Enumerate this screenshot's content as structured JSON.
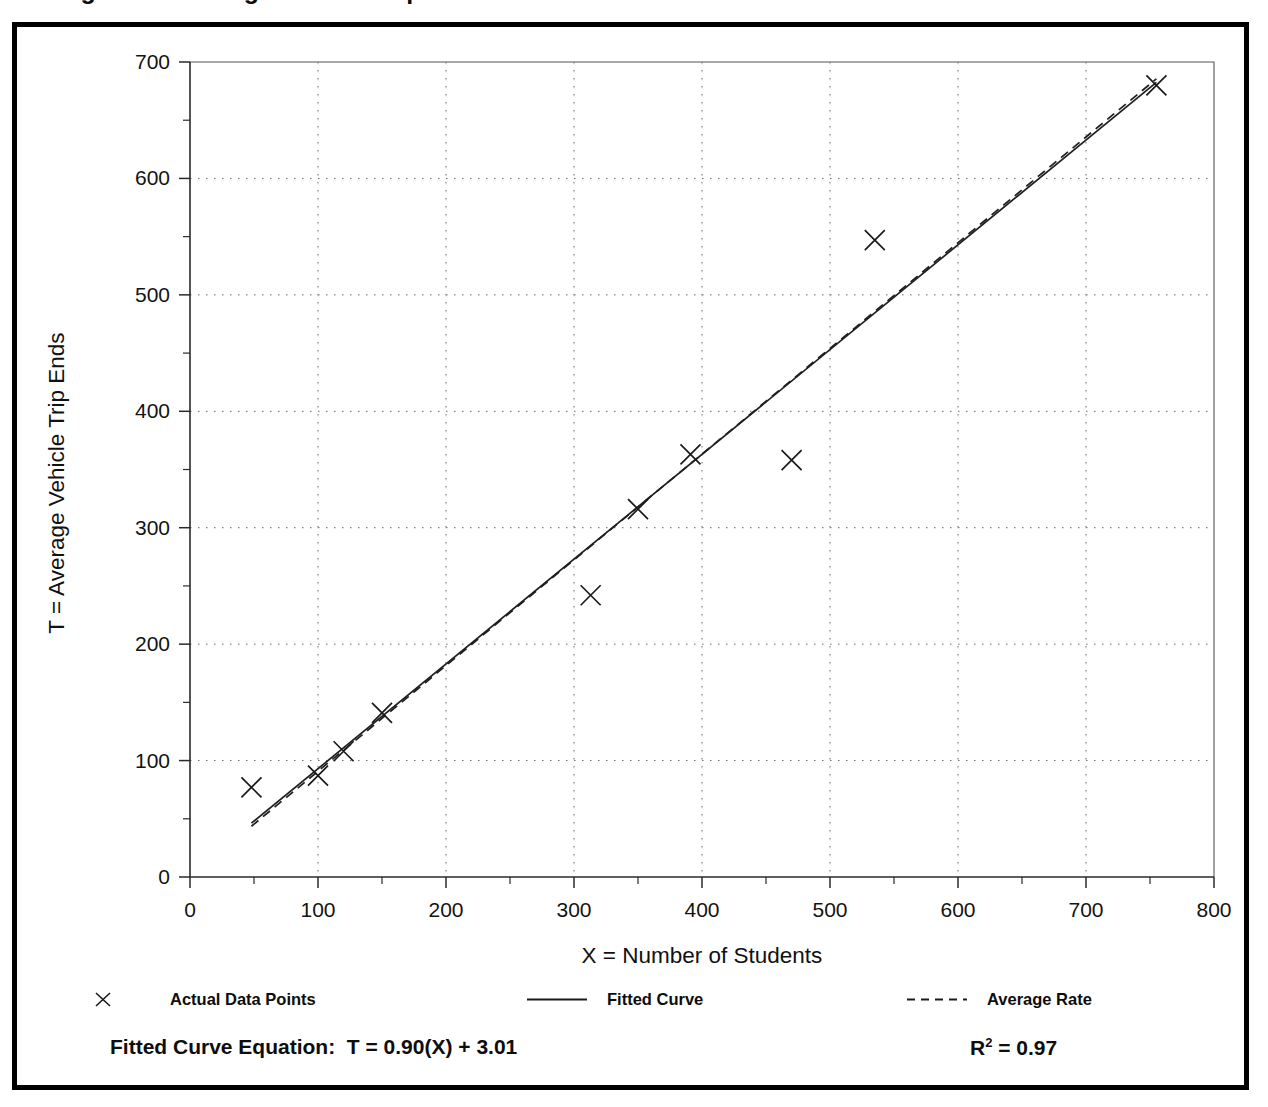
{
  "page": {
    "cut_title": "Figure — Average Vehicle Trip Ends"
  },
  "axis": {
    "x_title": "X = Number of Students",
    "y_title": "T = Average Vehicle Trip Ends",
    "x_ticks": [
      "0",
      "100",
      "200",
      "300",
      "400",
      "500",
      "600",
      "700",
      "800"
    ],
    "y_ticks": [
      "0",
      "100",
      "200",
      "300",
      "400",
      "500",
      "600",
      "700"
    ]
  },
  "legend": {
    "items": [
      {
        "label": "Actual Data Points",
        "marker": "cross-marker-icon"
      },
      {
        "label": "Fitted Curve",
        "marker": "solid-line-icon"
      },
      {
        "label": "Average Rate",
        "marker": "dashed-line-icon"
      }
    ]
  },
  "footer": {
    "equation_label": "Fitted Curve Equation:",
    "equation_value": "T = 0.90(X) + 3.01",
    "r2_label": "R",
    "r2_exponent": "2",
    "r2_value": "= 0.97"
  },
  "chart_data": {
    "type": "scatter",
    "title": "",
    "xlabel": "X = Number of Students",
    "ylabel": "T = Average Vehicle Trip Ends",
    "xlim": [
      0,
      800
    ],
    "ylim": [
      0,
      700
    ],
    "xtick_step": 100,
    "ytick_step": 100,
    "minor_tick_step": 50,
    "grid": true,
    "grid_style": "dotted",
    "legend_position": "below-plot",
    "points": [
      {
        "x": 48,
        "y": 77
      },
      {
        "x": 100,
        "y": 87
      },
      {
        "x": 120,
        "y": 108
      },
      {
        "x": 150,
        "y": 141
      },
      {
        "x": 313,
        "y": 242
      },
      {
        "x": 350,
        "y": 316
      },
      {
        "x": 391,
        "y": 363
      },
      {
        "x": 470,
        "y": 358
      },
      {
        "x": 535,
        "y": 547
      },
      {
        "x": 755,
        "y": 680
      }
    ],
    "series": [
      {
        "name": "Fitted Curve",
        "type": "line",
        "style": "solid",
        "equation": "T = 0.90(X) + 3.01",
        "slope": 0.9,
        "intercept": 3.01,
        "r_squared": 0.97,
        "x_start": 48,
        "x_end": 755
      },
      {
        "name": "Average Rate",
        "type": "line",
        "style": "dashed",
        "slope": 0.908,
        "intercept": 0.0,
        "x_start": 48,
        "x_end": 755
      }
    ]
  }
}
